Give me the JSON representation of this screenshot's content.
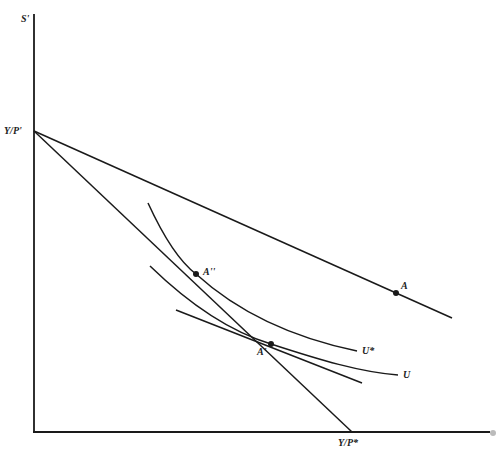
{
  "diagram": {
    "type": "indifference-curve budget-constraint diagram",
    "axes": {
      "y_label": "S'",
      "x_label": ""
    },
    "intercepts": {
      "y_intercept_label": "Y/P'",
      "x_intercept_label": "Y/P*"
    },
    "points": [
      {
        "label": "A",
        "on": "budget line from Y/P' (flatter)"
      },
      {
        "label": "A''",
        "on": "U* and steeper line Y/P' to Y/P*"
      },
      {
        "label": "A'",
        "on": "U, steeper line, and tangent line"
      }
    ],
    "curves": [
      {
        "label": "U*"
      },
      {
        "label": "U"
      }
    ],
    "colors": {
      "ink": "#1a1a1a",
      "background": "#ffffff"
    }
  }
}
